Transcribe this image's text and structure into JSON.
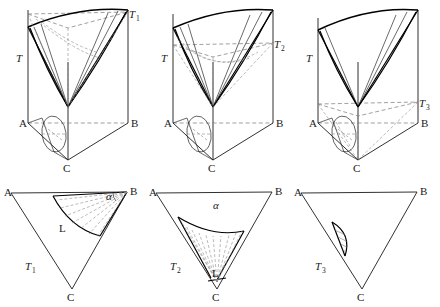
{
  "figure": {
    "caption": "",
    "panel_count": 6,
    "rows": 2,
    "columns": 3
  },
  "labels": {
    "A": "A",
    "B": "B",
    "C": "C",
    "T": "T",
    "T1_base": "T",
    "T1_sub": "1",
    "T2_base": "T",
    "T2_sub": "2",
    "T3_base": "T",
    "T3_sub": "3",
    "L": "L",
    "alpha": "α"
  },
  "panels": [
    {
      "id": "panel-top-left",
      "row": 1,
      "column": 1,
      "type": "3d-prism-with-cone",
      "vertex_labels": [
        "A",
        "B",
        "C",
        "T"
      ],
      "apex_label_base": "T",
      "apex_label_sub": "1",
      "base_region": "half-disk",
      "description_label": "T1"
    },
    {
      "id": "panel-top-middle",
      "row": 1,
      "column": 2,
      "type": "3d-prism-with-cone",
      "vertex_labels": [
        "A",
        "B",
        "C",
        "T"
      ],
      "apex_label_base": "T",
      "apex_label_sub": "2",
      "base_region": "half-disk",
      "description_label": "T2"
    },
    {
      "id": "panel-top-right",
      "row": 1,
      "column": 3,
      "type": "3d-prism-with-cone",
      "vertex_labels": [
        "A",
        "B",
        "C",
        "T"
      ],
      "apex_label_base": "T",
      "apex_label_sub": "3",
      "base_region": "half-disk",
      "description_label": "T3"
    },
    {
      "id": "panel-bottom-left",
      "row": 2,
      "column": 1,
      "type": "2d-triangle-sector",
      "vertex_labels": [
        "A",
        "B",
        "C"
      ],
      "sector_apex": "B",
      "angle_label": "α",
      "region_label": "L",
      "triangle_label_base": "T",
      "triangle_label_sub": "1"
    },
    {
      "id": "panel-bottom-middle",
      "row": 2,
      "column": 2,
      "type": "2d-triangle-sector",
      "vertex_labels": [
        "A",
        "B",
        "C"
      ],
      "sector_apex": "C",
      "angle_label": "α",
      "region_label": "L",
      "triangle_label_base": "T",
      "triangle_label_sub": "2"
    },
    {
      "id": "panel-bottom-right",
      "row": 2,
      "column": 3,
      "type": "2d-triangle-halfdisk",
      "vertex_labels": [
        "A",
        "B",
        "C"
      ],
      "region_shape": "hatched-half-disk",
      "triangle_label_base": "T",
      "triangle_label_sub": "3"
    }
  ],
  "colors": {
    "stroke": "#1a1a1a",
    "dashed": "#7d7d7d",
    "background": "#ffffff"
  }
}
